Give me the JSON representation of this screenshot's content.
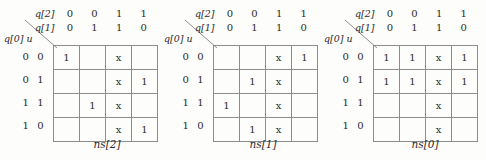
{
  "figure": {
    "type": "karnaugh-map-set",
    "map_count": 3,
    "col_var_top_label": "q[2]",
    "col_var_bottom_label": "q[1]",
    "corner_label": "q[0] u",
    "col_headers_top": [
      "0",
      "0",
      "1",
      "1"
    ],
    "col_headers_bottom": [
      "0",
      "1",
      "1",
      "0"
    ],
    "row_labels": [
      "0 0",
      "0 1",
      "1 1",
      "1 0"
    ],
    "grid_line_color": "#8d8d8d",
    "background_color": "#fdfdfb",
    "text_color": "#2a2a2a"
  },
  "maps": [
    {
      "caption": "ns[2]",
      "cells": [
        [
          "1",
          "",
          "x",
          ""
        ],
        [
          "",
          "",
          "x",
          "1"
        ],
        [
          "",
          "1",
          "x",
          ""
        ],
        [
          "",
          "",
          "x",
          "1"
        ]
      ]
    },
    {
      "caption": "ns[1]",
      "cells": [
        [
          "",
          "",
          "x",
          "1"
        ],
        [
          "",
          "1",
          "x",
          ""
        ],
        [
          "1",
          "",
          "x",
          ""
        ],
        [
          "",
          "1",
          "x",
          ""
        ]
      ]
    },
    {
      "caption": "ns[0]",
      "cells": [
        [
          "1",
          "1",
          "x",
          "1"
        ],
        [
          "1",
          "1",
          "x",
          "1"
        ],
        [
          "",
          "",
          "x",
          ""
        ],
        [
          "",
          "",
          "x",
          ""
        ]
      ]
    }
  ]
}
